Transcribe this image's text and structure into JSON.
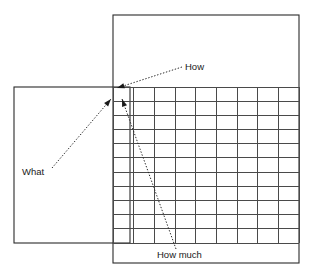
{
  "diagram": {
    "type": "house-of-quality-qfd-matrix",
    "canvas": {
      "width": 312,
      "height": 273,
      "background": "#ffffff"
    },
    "stroke_color": "#2b2b2b",
    "grid_color": "#4a4a4a",
    "text_color": "#1a1a1a",
    "shapes": [
      {
        "name": "what-box",
        "role": "left requirements box",
        "x": 14,
        "y": 87,
        "width": 116,
        "height": 156,
        "filled": false
      },
      {
        "name": "how-box",
        "role": "upper-right technical characteristics box",
        "x": 113,
        "y": 15,
        "width": 186,
        "height": 248,
        "filled": false
      }
    ],
    "grid": {
      "name": "relationship-matrix",
      "x": 113,
      "y": 87,
      "width": 186,
      "height": 156,
      "columns": 9,
      "rows": 11
    },
    "labels": [
      {
        "id": "how",
        "text": "How",
        "x": 185,
        "y": 70,
        "anchor": "start",
        "leader": {
          "from_x": 182,
          "from_y": 67,
          "to_x": 117,
          "to_y": 88
        }
      },
      {
        "id": "what",
        "text": "What",
        "x": 22,
        "y": 175,
        "anchor": "start",
        "leader": {
          "from_x": 52,
          "from_y": 168,
          "to_x": 111,
          "to_y": 99
        }
      },
      {
        "id": "how-much",
        "text": "How much",
        "x": 157,
        "y": 258,
        "anchor": "start",
        "leader": {
          "from_x": 176,
          "from_y": 249,
          "to_x": 122,
          "to_y": 99
        }
      }
    ]
  }
}
